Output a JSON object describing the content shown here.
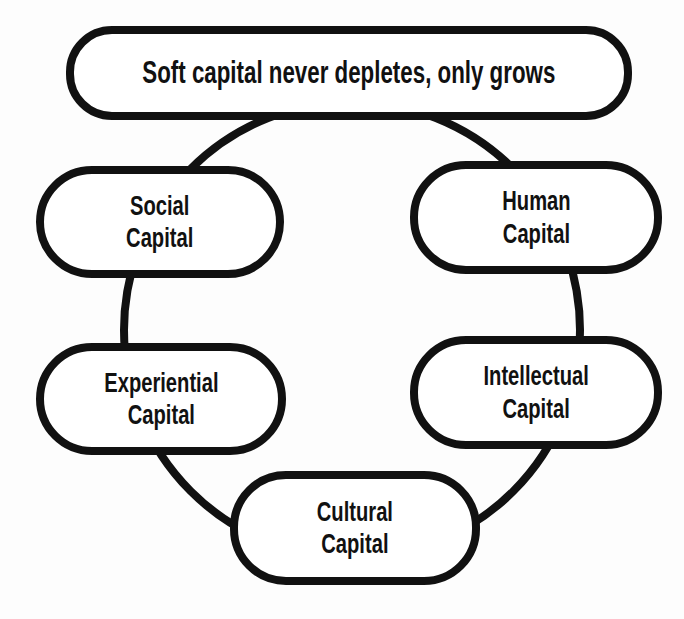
{
  "diagram": {
    "title": "Soft capital never depletes, only grows",
    "nodes": [
      {
        "id": "social",
        "line1": "Social",
        "line2": "Capital"
      },
      {
        "id": "human",
        "line1": "Human",
        "line2": "Capital"
      },
      {
        "id": "experiential",
        "line1": "Experiential",
        "line2": "Capital"
      },
      {
        "id": "intellectual",
        "line1": "Intellectual",
        "line2": "Capital"
      },
      {
        "id": "cultural",
        "line1": "Cultural",
        "line2": "Capital"
      }
    ],
    "colors": {
      "stroke": "#111111",
      "fill": "#ffffff",
      "background": "#fdfdfd"
    }
  }
}
